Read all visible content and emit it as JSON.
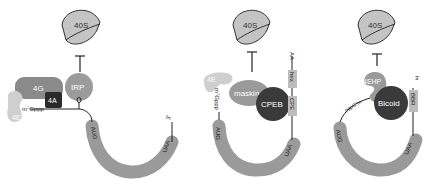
{
  "colors": {
    "ribosome": "#c4c4c4",
    "mrna": "#9a9a9a",
    "eif4g": "#8a8a8a",
    "eif4e_light": "#cfcfcf",
    "eif4a": "#2a2a2a",
    "irp": "#9b9b9b",
    "maskin": "#9a9a9a",
    "cpeb": "#3a3a3a",
    "bicoid": "#3a3a3a",
    "eif4ehp": "#9a9a9a",
    "element_box": "#bdbdbd",
    "line": "#222222"
  },
  "panels": [
    {
      "id": "irp",
      "ribosome_label": "40S",
      "proteins": {
        "g": "4G",
        "a": "4A",
        "e": "4E",
        "repressor": "IRP"
      },
      "cap_label": "m⁷Gppp",
      "start_codon": "AUG",
      "stop_codon": "UAA",
      "three_prime": "3'"
    },
    {
      "id": "cpeb",
      "ribosome_label": "40S",
      "proteins": {
        "e": "4E",
        "adaptor": "maskin",
        "repressor": "CPEB"
      },
      "cap_label": "m⁷Gppp",
      "start_codon": "AUG",
      "stop_codon": "UAA",
      "elements": [
        "CPE",
        "hex"
      ],
      "tail": "AA"
    },
    {
      "id": "bicoid",
      "ribosome_label": "40S",
      "proteins": {
        "cap_binder": "4EHP",
        "repressor": "Bicoid"
      },
      "cap_label": "pppG⁷m",
      "start_codon": "AUG",
      "stop_codon": "UAA",
      "elements": [
        "BBR"
      ],
      "three_prime": "3'"
    }
  ]
}
